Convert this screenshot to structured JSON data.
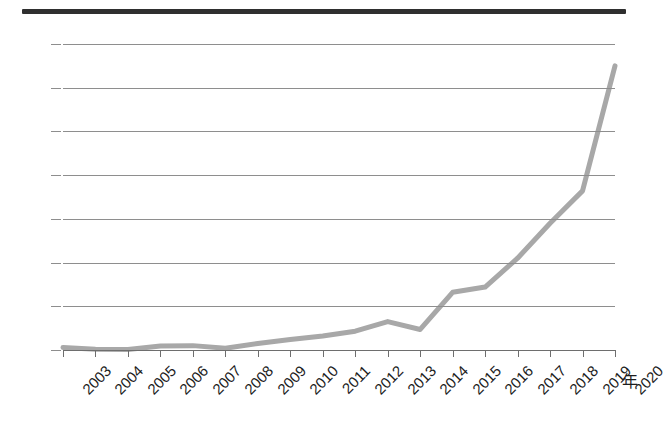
{
  "chart_data": {
    "type": "line",
    "title": "",
    "xlabel": "年",
    "ylabel": "",
    "categories": [
      "2003",
      "2004",
      "2005",
      "2006",
      "2007",
      "2008",
      "2009",
      "2010",
      "2011",
      "2012",
      "2013",
      "2014",
      "2015",
      "2016",
      "2017",
      "2018",
      "2019",
      "2020"
    ],
    "x": [
      2003,
      2004,
      2005,
      2006,
      2007,
      2008,
      2009,
      2010,
      2011,
      2012,
      2013,
      2014,
      2015,
      2016,
      2017,
      2018,
      2019,
      2020
    ],
    "values": [
      30,
      10,
      5,
      45,
      50,
      20,
      75,
      120,
      160,
      215,
      325,
      235,
      660,
      720,
      1050,
      1450,
      1820,
      3250
    ],
    "series": [
      {
        "name": "",
        "values": [
          30,
          10,
          5,
          45,
          50,
          20,
          75,
          120,
          160,
          215,
          325,
          235,
          660,
          720,
          1050,
          1450,
          1820,
          3250
        ],
        "color": "#a8a8a8"
      }
    ],
    "ylim": [
      0,
      3500
    ],
    "yticks": [
      0,
      500,
      1000,
      1500,
      2000,
      2500,
      3000,
      3500
    ],
    "ytick_labels": [
      "0",
      "500",
      "1,000",
      "1,500",
      "2,000",
      "2,500",
      "3,000",
      "3,500"
    ],
    "grid": true,
    "legend": false,
    "legend_position": "none"
  },
  "axis": {
    "x_unit_label": "年"
  },
  "style": {
    "line_color": "#a8a8a8",
    "grid_color": "#8e8e8e",
    "text_color": "#1d1d1d",
    "rule_color": "#2f2f2f",
    "background": "#ffffff"
  },
  "header": {
    "clipped_title": ""
  }
}
